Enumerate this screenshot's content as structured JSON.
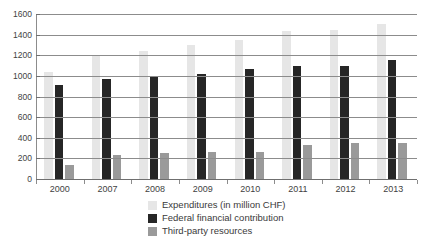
{
  "chart_data": {
    "type": "bar",
    "title": "",
    "xlabel": "",
    "ylabel": "",
    "categories": [
      "2000",
      "2007",
      "2008",
      "2009",
      "2010",
      "2011",
      "2012",
      "2013"
    ],
    "series": [
      {
        "name": "Expenditures (in million CHF)",
        "color": "#e6e6e6",
        "values": [
          1040,
          1200,
          1240,
          1300,
          1350,
          1440,
          1445,
          1505
        ]
      },
      {
        "name": "Federal financial contribution",
        "color": "#262626",
        "values": [
          910,
          965,
          1000,
          1020,
          1070,
          1100,
          1100,
          1155
        ]
      },
      {
        "name": "Third-party resources",
        "color": "#9a9a9a",
        "values": [
          140,
          230,
          250,
          260,
          265,
          330,
          350,
          350
        ]
      }
    ],
    "ylim": [
      0,
      1600
    ],
    "ytick_values": [
      0,
      200,
      400,
      600,
      800,
      1000,
      1200,
      1400,
      1600
    ],
    "ytick_labels": [
      "0",
      "200",
      "400",
      "600",
      "800",
      "1000",
      "1200",
      "1400",
      "1600"
    ],
    "grid": true,
    "legend_position": "bottom"
  },
  "legend": {
    "items": [
      {
        "label": "Expenditures (in million CHF)"
      },
      {
        "label": "Federal financial contribution"
      },
      {
        "label": "Third-party resources"
      }
    ]
  }
}
